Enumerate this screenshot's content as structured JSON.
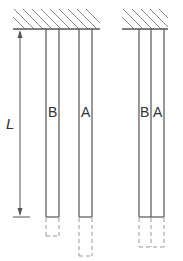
{
  "diagram": {
    "type": "mechanics-bars",
    "dimension_label": "L",
    "left_group": {
      "bar_labels": [
        "B",
        "A"
      ]
    },
    "right_group": {
      "bar_labels": [
        "B",
        "A"
      ]
    },
    "colors": {
      "line": "#555555",
      "hatch": "#888888",
      "dashed": "#999999",
      "text": "#333333"
    }
  }
}
